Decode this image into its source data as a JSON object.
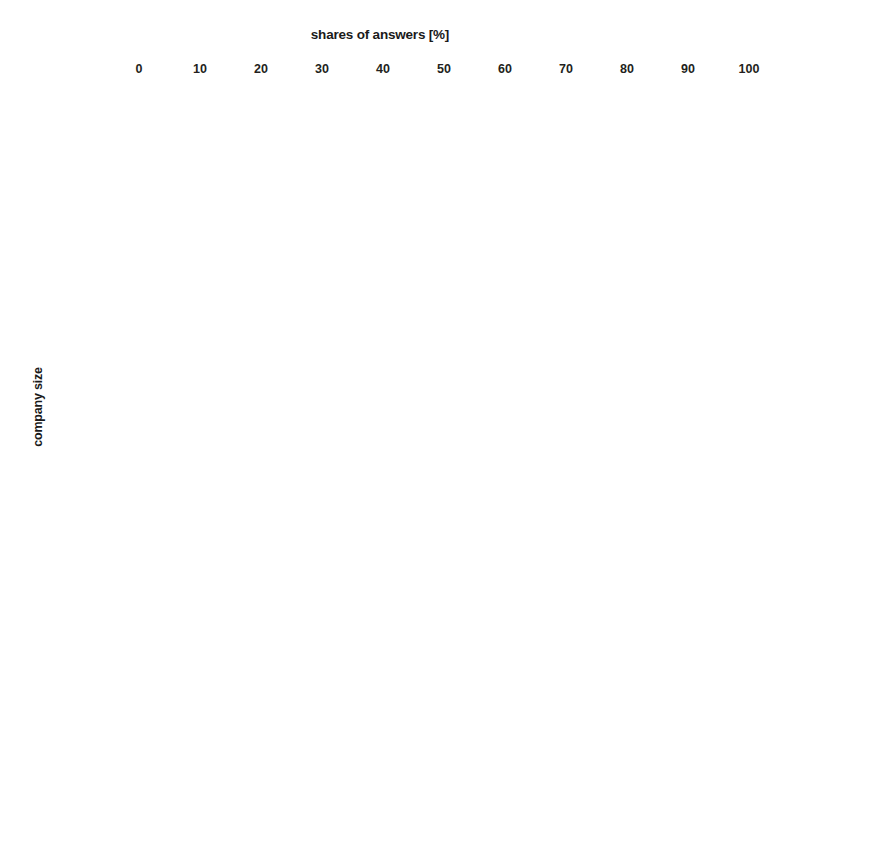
{
  "chart_data": {
    "type": "bar",
    "orientation": "horizontal",
    "title": "shares of answers [%]",
    "xlabel": "shares of answers [%]",
    "ylabel": "company size",
    "xlim": [
      0,
      100
    ],
    "xticks": [
      0,
      10,
      20,
      30,
      40,
      50,
      60,
      70,
      80,
      90,
      100
    ],
    "grid": true,
    "legend_position": "right",
    "categories": [
      "micro",
      "small",
      "medium"
    ],
    "legend": [
      "always",
      "sometimes",
      "never"
    ],
    "colors": {
      "always": "#6e6e6e",
      "sometimes": "#555555",
      "never": "#a8a8a8"
    },
    "panels": [
      {
        "caption": "Do you create schedule of  construction works?",
        "series": [
          {
            "name": "always",
            "values": [
              41,
              65,
              98
            ]
          },
          {
            "name": "sometimes",
            "values": [
              46,
              30,
              0
            ]
          },
          {
            "name": "never",
            "values": [
              11,
              3,
              1
            ]
          }
        ]
      },
      {
        "caption": "Do you create quality plan for construction realization?",
        "series": [
          {
            "name": "always",
            "values": [
              16,
              45,
              75
            ]
          },
          {
            "name": "sometimes",
            "values": [
              44,
              39,
              17
            ]
          },
          {
            "name": "never",
            "values": [
              39,
              15,
              6
            ]
          }
        ]
      },
      {
        "caption": "Do you create proposal of storage space site?",
        "series": [
          {
            "name": "always",
            "values": [
              34,
              47,
              68
            ]
          },
          {
            "name": "sometimes",
            "values": [
              46,
              43,
              26
            ]
          },
          {
            "name": "never",
            "values": [
              17,
              7,
              4
            ]
          }
        ]
      }
    ]
  },
  "axis": {
    "x_tick_labels": [
      "0",
      "10",
      "20",
      "30",
      "40",
      "50",
      "60",
      "70",
      "80",
      "90",
      "100"
    ]
  },
  "title": {
    "text": "shares of answers [%]"
  },
  "y_axis_title": {
    "text": "company size"
  },
  "legend": {
    "items": [
      {
        "label": "always"
      },
      {
        "label": "sometimes"
      },
      {
        "label": "never"
      }
    ]
  },
  "panels": [
    {
      "caption": "Do you create schedule of  construction works?",
      "categories": [
        "micro",
        "small",
        "medium"
      ]
    },
    {
      "caption": "Do you create quality plan for construction realization?",
      "categories": [
        "micro",
        "small",
        "medium"
      ]
    },
    {
      "caption": "Do you create proposal of storage space site?",
      "categories": [
        "micro",
        "small",
        "medium"
      ]
    }
  ]
}
